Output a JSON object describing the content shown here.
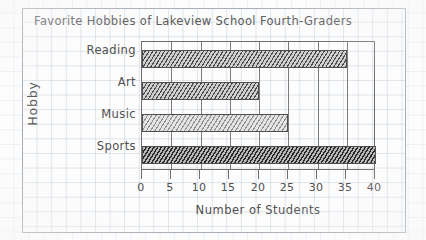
{
  "chart_data": {
    "type": "bar",
    "orientation": "horizontal",
    "title": "Favorite Hobbies of Lakeview School Fourth-Graders",
    "xlabel": "Number of Students",
    "ylabel": "Hobby",
    "categories": [
      "Reading",
      "Art",
      "Music",
      "Sports"
    ],
    "values": [
      35,
      20,
      25,
      40
    ],
    "xlim": [
      0,
      40
    ],
    "xticks": [
      0,
      5,
      10,
      15,
      20,
      25,
      30,
      35,
      40
    ],
    "xticklabels": [
      "0",
      "5",
      "10",
      "15",
      "20",
      "25",
      "30",
      "35",
      "40"
    ],
    "grid": true,
    "gridlines": "vertical-every-5",
    "legend": null,
    "style": "hand-drawn pencil on graph paper",
    "bar_shading": [
      "hatched-medium",
      "hatched-medium",
      "hatched-light",
      "hatched-dark"
    ]
  },
  "colors": {
    "paper": "#fdfdfd",
    "grid": "#96aabe",
    "ink": "#4f4f4f",
    "frame": "#6d6d6d",
    "sheet_border": "#9aa3ad"
  }
}
